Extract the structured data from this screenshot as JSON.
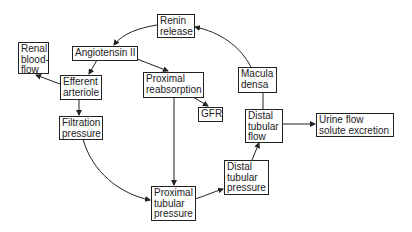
{
  "diagram": {
    "nodes": {
      "renin_release": {
        "lines": [
          "Renin",
          "release"
        ]
      },
      "angiotensin": {
        "lines": [
          "Angiotensin II"
        ]
      },
      "renal_blood_flow": {
        "lines": [
          "Renal",
          "blood-",
          "flow"
        ]
      },
      "efferent_arteriole": {
        "lines": [
          "Efferent",
          "arteriole"
        ]
      },
      "proximal_reabsorption": {
        "lines": [
          "Proximal",
          "reabsorption"
        ]
      },
      "gfr": {
        "lines": [
          "GFR"
        ]
      },
      "macula_densa": {
        "lines": [
          "Macula",
          "densa"
        ]
      },
      "filtration_pressure": {
        "lines": [
          "Filtration",
          "pressure"
        ]
      },
      "distal_tubular_flow": {
        "lines": [
          "Distal",
          "tubular",
          "flow"
        ]
      },
      "urine_flow": {
        "lines": [
          "Urine flow",
          "solute excretion"
        ]
      },
      "distal_tubular_pressure": {
        "lines": [
          "Distal",
          "tubular",
          "pressure"
        ]
      },
      "proximal_tubular_pressure": {
        "lines": [
          "Proximal",
          "tubular",
          "pressure"
        ]
      }
    },
    "edges": [
      {
        "from": "Renin release",
        "to": "Angiotensin II"
      },
      {
        "from": "Angiotensin II",
        "to": "Efferent arteriole"
      },
      {
        "from": "Angiotensin II",
        "to": "Proximal reabsorption"
      },
      {
        "from": "Efferent arteriole",
        "to": "Renal blood-flow"
      },
      {
        "from": "Efferent arteriole",
        "to": "Filtration pressure"
      },
      {
        "from": "Proximal reabsorption",
        "to": "GFR"
      },
      {
        "from": "Proximal reabsorption",
        "to": "Proximal tubular pressure"
      },
      {
        "from": "Filtration pressure",
        "to": "Proximal tubular pressure"
      },
      {
        "from": "Proximal tubular pressure",
        "to": "Distal tubular pressure"
      },
      {
        "from": "Distal tubular pressure",
        "to": "Distal tubular flow"
      },
      {
        "from": "Distal tubular flow",
        "to": "Macula densa"
      },
      {
        "from": "Distal tubular flow",
        "to": "Urine flow solute excretion"
      },
      {
        "from": "Macula densa",
        "to": "Renin release"
      }
    ],
    "colors": {
      "line": "#222222",
      "background": "#ffffff"
    }
  }
}
